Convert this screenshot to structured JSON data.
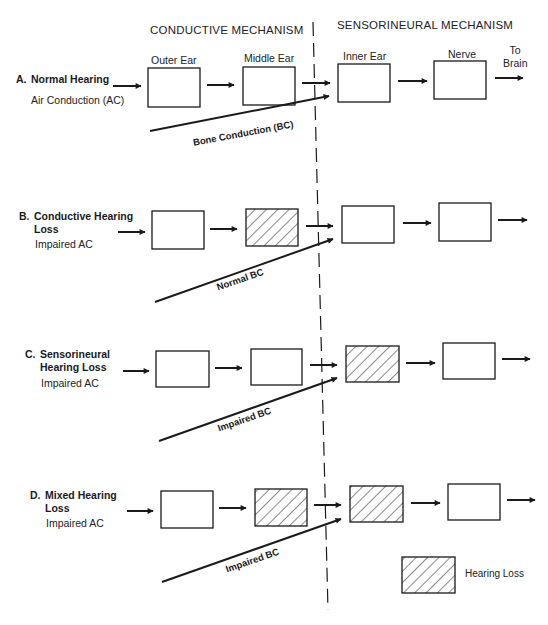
{
  "headers": {
    "conductive": "CONDUCTIVE MECHANISM",
    "sensorineural": "SENSORINEURAL MECHANISM"
  },
  "columns": {
    "outer_ear": "Outer Ear",
    "middle_ear": "Middle Ear",
    "inner_ear": "Inner Ear",
    "nerve": "Nerve",
    "to_brain_line1": "To",
    "to_brain_line2": "Brain"
  },
  "rows": [
    {
      "letter": "A.",
      "title_line1": "Normal Hearing",
      "title_line2": "",
      "subtitle": "Air Conduction (AC)",
      "bc_label": "Bone Conduction (BC)",
      "impaired": {
        "outer_ear": false,
        "middle_ear": false,
        "inner_ear": false,
        "nerve": false
      }
    },
    {
      "letter": "B.",
      "title_line1": "Conductive Hearing",
      "title_line2": "Loss",
      "subtitle": "Impaired AC",
      "bc_label": "Normal BC",
      "impaired": {
        "outer_ear": false,
        "middle_ear": true,
        "inner_ear": false,
        "nerve": false
      }
    },
    {
      "letter": "C.",
      "title_line1": "Sensorineural",
      "title_line2": "Hearing Loss",
      "subtitle": "Impaired AC",
      "bc_label": "Impaired BC",
      "impaired": {
        "outer_ear": false,
        "middle_ear": false,
        "inner_ear": true,
        "nerve": false
      }
    },
    {
      "letter": "D.",
      "title_line1": "Mixed Hearing",
      "title_line2": "Loss",
      "subtitle": "Impaired AC",
      "bc_label": "Impaired BC",
      "impaired": {
        "outer_ear": false,
        "middle_ear": true,
        "inner_ear": true,
        "nerve": false
      }
    }
  ],
  "legend": {
    "label": "Hearing Loss",
    "swatch": "hatched"
  },
  "colors": {
    "ink": "#1a1a1a",
    "background": "#ffffff"
  }
}
